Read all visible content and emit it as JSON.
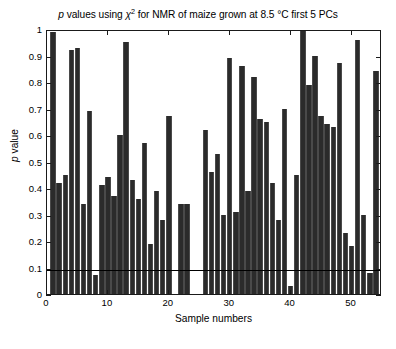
{
  "chart_data": {
    "type": "bar",
    "title_parts": {
      "p": "p",
      "mid1": " values using ",
      "chi": "χ",
      "sup": "2",
      "mid2": " for NMR of maize grown at 8.5 °C first 5 PCs"
    },
    "xlabel": "Sample numbers",
    "ylabel": "p value",
    "ylabel_parts": {
      "p": "p",
      "rest": " value"
    },
    "xlim": [
      0,
      55
    ],
    "ylim": [
      0,
      1
    ],
    "yticks": [
      0,
      0.1,
      0.2,
      0.3,
      0.4,
      0.5,
      0.6,
      0.7,
      0.8,
      0.9,
      1
    ],
    "ytick_labels": [
      "0",
      "0.1",
      "0.2",
      "0.3",
      "0.4",
      "0.5",
      "0.6",
      "0.7",
      "0.8",
      "0.9",
      "1"
    ],
    "xticks": [
      0,
      10,
      20,
      30,
      40,
      50
    ],
    "xtick_labels": [
      "0",
      "10",
      "20",
      "30",
      "40",
      "50"
    ],
    "grid": false,
    "legend": null,
    "bar_color": "#2b2b2b",
    "threshold": {
      "value": 0.1,
      "color": "#000000",
      "label": "0.1 significance line"
    },
    "categories": [
      1,
      2,
      3,
      4,
      5,
      6,
      7,
      8,
      9,
      10,
      11,
      12,
      13,
      14,
      15,
      16,
      17,
      18,
      19,
      20,
      21,
      22,
      23,
      24,
      25,
      26,
      27,
      28,
      29,
      30,
      31,
      32,
      33,
      34,
      35,
      36,
      37,
      38,
      39,
      40,
      41,
      42,
      43,
      44,
      45,
      46,
      47,
      48,
      49,
      50,
      51,
      52,
      53,
      54
    ],
    "values": [
      0.99,
      0.42,
      0.45,
      0.92,
      0.93,
      0.34,
      0.69,
      0.07,
      0.41,
      0.44,
      0.37,
      0.6,
      0.95,
      0.43,
      0.36,
      0.57,
      0.19,
      0.39,
      0.28,
      0.67,
      0.0,
      0.34,
      0.34,
      0.0,
      0.0,
      0.62,
      0.46,
      0.53,
      0.3,
      0.89,
      0.31,
      0.86,
      0.39,
      0.82,
      0.66,
      0.65,
      0.42,
      0.28,
      0.7,
      0.03,
      0.45,
      1.0,
      0.79,
      0.9,
      0.67,
      0.64,
      0.63,
      0.87,
      0.23,
      0.18,
      0.96,
      0.3,
      0.08,
      0.84
    ]
  }
}
